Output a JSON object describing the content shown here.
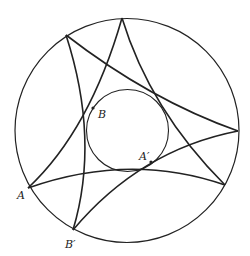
{
  "diagram": {
    "type": "hyperbolic-disk-geodesics",
    "colors": {
      "stroke": "#222222",
      "background": "#ffffff"
    },
    "outer_circle": {
      "cx": 127,
      "cy": 130.5,
      "r": 112
    },
    "inner_circle": {
      "cx": 127.5,
      "cy": 130.5,
      "r": 41
    },
    "vertices": [
      {
        "id": "top",
        "x": 122,
        "y": 18
      },
      {
        "id": "upper-left",
        "x": 66,
        "y": 35
      },
      {
        "id": "right",
        "x": 238,
        "y": 131
      },
      {
        "id": "lower-right",
        "x": 225,
        "y": 185
      },
      {
        "id": "A",
        "x": 28,
        "y": 188
      },
      {
        "id": "B-prime",
        "x": 73,
        "y": 230
      }
    ],
    "arcs": [
      {
        "id": "upperleft-to-right",
        "d": "M66,35 Q150,100 238,131"
      },
      {
        "id": "upperleft-to-Bprime",
        "d": "M66,35 Q100,140 73,230"
      },
      {
        "id": "top-to-A",
        "d": "M122,18 Q90,130 28,188"
      },
      {
        "id": "top-to-lowerright",
        "d": "M122,18 Q150,110 225,185"
      },
      {
        "id": "A-to-lowerright",
        "d": "M28,188 Q130,152 225,185"
      },
      {
        "id": "Bprime-to-right",
        "d": "M73,230 Q140,150 238,131"
      }
    ],
    "points": [
      {
        "id": "B",
        "x": 93,
        "y": 108
      },
      {
        "id": "A-prime",
        "x": 151,
        "y": 162
      }
    ],
    "labels": [
      {
        "id": "A",
        "text": "A",
        "x": 17,
        "y": 199
      },
      {
        "id": "B",
        "text": "B",
        "x": 98,
        "y": 118
      },
      {
        "id": "A-prime",
        "text": "A′",
        "x": 139,
        "y": 160
      },
      {
        "id": "B-prime",
        "text": "B′",
        "x": 65,
        "y": 248
      }
    ]
  }
}
